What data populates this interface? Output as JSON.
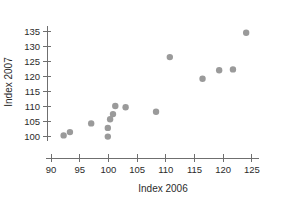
{
  "chart_data": {
    "type": "scatter",
    "title": "",
    "xlabel": "Index 2006",
    "ylabel": "Index 2007",
    "xlim": [
      89.2,
      126.2
    ],
    "ylim": [
      98.2,
      136.6
    ],
    "xticks": [
      90,
      95,
      100,
      105,
      110,
      115,
      120,
      125
    ],
    "xticklabels": [
      "90",
      "95",
      "100",
      "105",
      "110",
      "115",
      "120",
      "125"
    ],
    "yticks": [
      100,
      105,
      110,
      115,
      120,
      125,
      130,
      135
    ],
    "yticklabels": [
      "100",
      "105",
      "110",
      "115",
      "120",
      "125",
      "130",
      "135"
    ],
    "grid": false,
    "legend": null,
    "marker_color": "#9a9a9a",
    "marker_size": 3.2,
    "x": [
      92.2,
      93.3,
      97.0,
      99.9,
      99.9,
      100.3,
      100.8,
      101.2,
      103.0,
      108.3,
      110.7,
      116.4,
      119.3,
      121.7,
      124.0
    ],
    "y": [
      100.2,
      101.3,
      104.2,
      99.8,
      102.7,
      105.6,
      107.3,
      110.0,
      109.6,
      108.1,
      126.3,
      119.1,
      121.9,
      122.2,
      134.4
    ],
    "points": [
      {
        "x": 92.2,
        "y": 100.2
      },
      {
        "x": 93.3,
        "y": 101.3
      },
      {
        "x": 97.0,
        "y": 104.2
      },
      {
        "x": 99.9,
        "y": 99.8
      },
      {
        "x": 99.9,
        "y": 102.7
      },
      {
        "x": 100.3,
        "y": 105.6
      },
      {
        "x": 100.8,
        "y": 107.3
      },
      {
        "x": 101.2,
        "y": 110.0
      },
      {
        "x": 103.0,
        "y": 109.6
      },
      {
        "x": 108.3,
        "y": 108.1
      },
      {
        "x": 110.7,
        "y": 126.3
      },
      {
        "x": 116.4,
        "y": 119.1
      },
      {
        "x": 119.3,
        "y": 121.9
      },
      {
        "x": 121.7,
        "y": 122.2
      },
      {
        "x": 124.0,
        "y": 134.4
      }
    ]
  },
  "axes": {
    "x_title": "Index 2006",
    "y_title": "Index 2007"
  }
}
